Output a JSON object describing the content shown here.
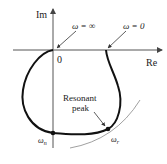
{
  "diagram": {
    "type": "polar-plot",
    "axes": {
      "vertical_label": "Im",
      "horizontal_label": "Re",
      "origin_label": "0"
    },
    "annotations": {
      "omega_infinity": "ω = ∞",
      "omega_zero": "ω = 0",
      "resonant_peak_line1": "Resonant",
      "resonant_peak_line2": "peak",
      "omega_n_base": "ω",
      "omega_n_sub": "n",
      "omega_r_base": "ω",
      "omega_r_sub": "r"
    },
    "colors": {
      "curve": "#111111",
      "axes": "#555555",
      "tangent_arc": "#888888"
    }
  }
}
